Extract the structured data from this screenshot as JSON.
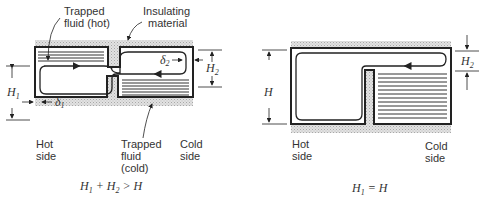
{
  "left_diagram": {
    "labels": {
      "trapped_hot_line1": "Trapped",
      "trapped_hot_line2": "fluid (hot)",
      "insulating_line1": "Insulating",
      "insulating_line2": "material",
      "hot_side_line1": "Hot",
      "hot_side_line2": "side",
      "trapped_cold_line1": "Trapped",
      "trapped_cold_line2": "fluid",
      "trapped_cold_line3": "(cold)",
      "cold_side_line1": "Cold",
      "cold_side_line2": "side"
    },
    "dimensions": {
      "h1": "H",
      "h1_sub": "1",
      "h2": "H",
      "h2_sub": "2",
      "delta1": "δ",
      "delta1_sub": "1",
      "delta2": "δ",
      "delta2_sub": "2"
    },
    "caption": {
      "part1": "H",
      "sub1": "1",
      "part2": " + H",
      "sub2": "2",
      "part3": " > H"
    }
  },
  "right_diagram": {
    "labels": {
      "hot_side_line1": "Hot",
      "hot_side_line2": "side",
      "cold_side_line1": "Cold",
      "cold_side_line2": "side"
    },
    "dimensions": {
      "h": "H",
      "h2": "H",
      "h2_sub": "2"
    },
    "caption": {
      "part1": "H",
      "sub1": "1",
      "part2": " = H"
    }
  },
  "colors": {
    "ink": "#222222",
    "insulation": "#d4d4d4"
  }
}
